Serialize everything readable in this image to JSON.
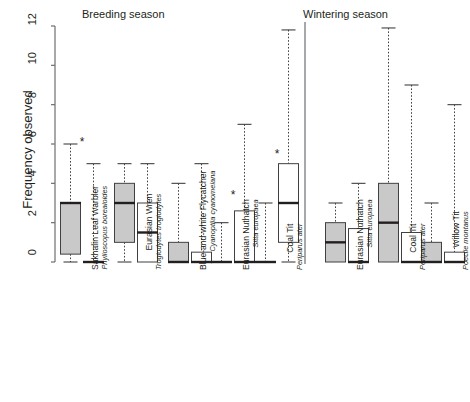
{
  "figure": {
    "ylabel": "Frequency observed",
    "sections": [
      {
        "id": "breeding",
        "label": "Breeding season"
      },
      {
        "id": "wintering",
        "label": "Wintering season"
      }
    ]
  },
  "chart_data": {
    "type": "box",
    "title": "",
    "xlabel": "",
    "ylabel": "Frequency observed",
    "ylim": [
      0,
      12
    ],
    "yticks": [
      0,
      2,
      4,
      6,
      8,
      10,
      12
    ],
    "ytick_labels": [
      "0",
      "2",
      "4",
      "6",
      "8",
      "10",
      "12"
    ],
    "grid": false,
    "legend": null,
    "panels": [
      "Breeding season",
      "Wintering season"
    ],
    "series": [
      {
        "name": "group-A",
        "fill": "#c9c9c9",
        "stroke": "#231f20"
      },
      {
        "name": "group-B",
        "fill": "#ffffff",
        "stroke": "#231f20"
      }
    ],
    "groups": [
      {
        "season": "Breeding season",
        "common_name": "Sakhalin Leaf Warbler",
        "scientific_name": "Phylloscopus borealoides",
        "significant": true,
        "boxes": [
          {
            "series": "group-A",
            "whisker_low": 0.0,
            "q1": 0.4,
            "median": 3.0,
            "q3": 3.0,
            "whisker_high": 6.0
          },
          {
            "series": "group-B",
            "whisker_low": 0.0,
            "q1": 0.0,
            "median": 0.0,
            "q3": 0.0,
            "whisker_high": 5.0
          }
        ]
      },
      {
        "season": "Breeding season",
        "common_name": "Eurasian Wren",
        "scientific_name": "Troglodytes troglodytes",
        "significant": false,
        "boxes": [
          {
            "series": "group-A",
            "whisker_low": 0.0,
            "q1": 1.0,
            "median": 3.0,
            "q3": 4.0,
            "whisker_high": 5.0
          },
          {
            "series": "group-B",
            "whisker_low": 0.0,
            "q1": 0.0,
            "median": 1.5,
            "q3": 3.0,
            "whisker_high": 5.0
          }
        ]
      },
      {
        "season": "Breeding season",
        "common_name": "Blue-and-white Flycatcher",
        "scientific_name": "Cyanoptila cyanomelana",
        "significant": false,
        "boxes": [
          {
            "series": "group-A",
            "whisker_low": 0.0,
            "q1": 0.0,
            "median": 0.0,
            "q3": 1.0,
            "whisker_high": 4.0
          },
          {
            "series": "group-B",
            "whisker_low": 0.0,
            "q1": 0.0,
            "median": 0.0,
            "q3": 0.5,
            "whisker_high": 5.0
          }
        ]
      },
      {
        "season": "Breeding season",
        "common_name": "Eurasian Nuthatch",
        "scientific_name": "Sitta europaea",
        "significant": true,
        "boxes": [
          {
            "series": "group-A",
            "whisker_low": 0.0,
            "q1": 0.0,
            "median": 0.0,
            "q3": 0.0,
            "whisker_high": 2.0
          },
          {
            "series": "group-B",
            "whisker_low": 0.0,
            "q1": 0.0,
            "median": 0.0,
            "q3": 2.6,
            "whisker_high": 7.0
          }
        ]
      },
      {
        "season": "Breeding season",
        "common_name": "Coal Tit",
        "scientific_name": "Periparus ater",
        "significant": true,
        "boxes": [
          {
            "series": "group-A",
            "whisker_low": 0.0,
            "q1": 0.0,
            "median": 0.0,
            "q3": 0.0,
            "whisker_high": 3.0
          },
          {
            "series": "group-B",
            "whisker_low": 0.0,
            "q1": 1.0,
            "median": 3.0,
            "q3": 5.0,
            "whisker_high": 11.8
          }
        ]
      },
      {
        "season": "Wintering season",
        "common_name": "Eurasian Nuthatch",
        "scientific_name": "Sitta europaea",
        "significant": false,
        "boxes": [
          {
            "series": "group-A",
            "whisker_low": 0.0,
            "q1": 0.0,
            "median": 1.0,
            "q3": 2.0,
            "whisker_high": 3.0
          },
          {
            "series": "group-B",
            "whisker_low": 0.0,
            "q1": 0.0,
            "median": 0.0,
            "q3": 1.7,
            "whisker_high": 4.0
          }
        ]
      },
      {
        "season": "Wintering season",
        "common_name": "Coal Tit",
        "scientific_name": "Periparus ater",
        "significant": false,
        "boxes": [
          {
            "series": "group-A",
            "whisker_low": 0.0,
            "q1": 0.0,
            "median": 2.0,
            "q3": 4.0,
            "whisker_high": 11.9
          },
          {
            "series": "group-B",
            "whisker_low": 0.0,
            "q1": 0.0,
            "median": 0.0,
            "q3": 1.5,
            "whisker_high": 9.0
          }
        ]
      },
      {
        "season": "Wintering season",
        "common_name": "Willow Tit",
        "scientific_name": "Poecile montanus",
        "significant": false,
        "boxes": [
          {
            "series": "group-A",
            "whisker_low": 0.0,
            "q1": 0.0,
            "median": 0.0,
            "q3": 1.0,
            "whisker_high": 3.0
          },
          {
            "series": "group-B",
            "whisker_low": 0.0,
            "q1": 0.0,
            "median": 0.0,
            "q3": 0.5,
            "whisker_high": 8.0
          }
        ]
      }
    ],
    "annotations": [
      {
        "text": "*",
        "group": "Sakhalin Leaf Warbler",
        "season": "Breeding season"
      },
      {
        "text": "*",
        "group": "Eurasian Nuthatch",
        "season": "Breeding season"
      },
      {
        "text": "*",
        "group": "Coal Tit",
        "season": "Breeding season"
      }
    ]
  }
}
